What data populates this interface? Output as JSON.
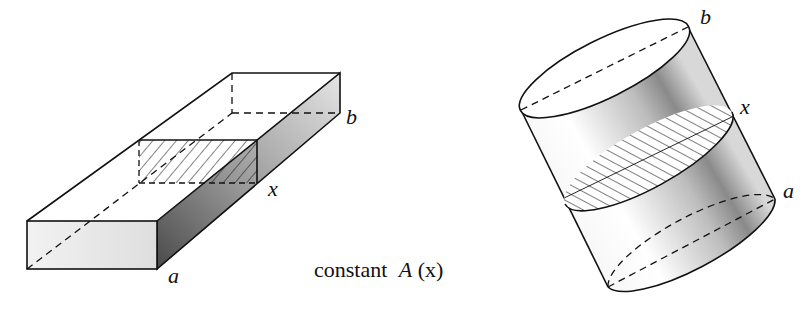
{
  "figure": {
    "caption_prefix": "constant",
    "caption_func": "A",
    "caption_arg": "(x)",
    "box": {
      "labels": {
        "a": "a",
        "x": "x",
        "b": "b"
      }
    },
    "cylinder": {
      "labels": {
        "a": "a",
        "x": "x",
        "b": "b"
      }
    }
  },
  "colors": {
    "ink": "#111111",
    "shade_dark": "#555555",
    "shade_light": "#e6e6e6"
  }
}
